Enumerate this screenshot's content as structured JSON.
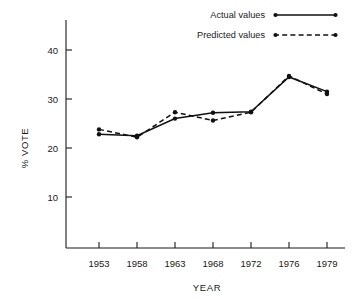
{
  "chart_data": {
    "type": "line",
    "title": "",
    "subtitle": "",
    "xlabel": "YEAR",
    "ylabel": "% VOTE",
    "x": [
      1953,
      1958,
      1963,
      1968,
      1972,
      1976,
      1979
    ],
    "categories": [
      "1953",
      "1958",
      "1963",
      "1968",
      "1972",
      "1976",
      "1979"
    ],
    "xticklabels": [
      "1953",
      "1958",
      "1963",
      "1968",
      "1972",
      "1976",
      "1979"
    ],
    "yticklabels": [
      "10",
      "20",
      "30",
      "40"
    ],
    "yticks": [
      10,
      20,
      30,
      40
    ],
    "xlim": [
      1950.5,
      1981.0
    ],
    "ylim": [
      0,
      44
    ],
    "grid": false,
    "legend_position": "top-right",
    "series": [
      {
        "name": "Actual values",
        "style": "solid",
        "marker": "dot",
        "color": "#111111",
        "values": [
          22.8,
          22.5,
          26.0,
          27.2,
          27.4,
          34.5,
          31.5
        ]
      },
      {
        "name": "Predicted values",
        "style": "dashed",
        "marker": "dot",
        "color": "#111111",
        "values": [
          23.8,
          22.2,
          27.3,
          25.6,
          27.3,
          34.7,
          31.0
        ]
      }
    ]
  },
  "legend": {
    "items": [
      {
        "label": "Actual values",
        "style": "solid"
      },
      {
        "label": "Predicted values",
        "style": "dashed"
      }
    ]
  },
  "axes": {
    "y_title": "% VOTE",
    "x_title": "YEAR"
  },
  "colors": {
    "ink": "#111111",
    "background": "#ffffff"
  }
}
